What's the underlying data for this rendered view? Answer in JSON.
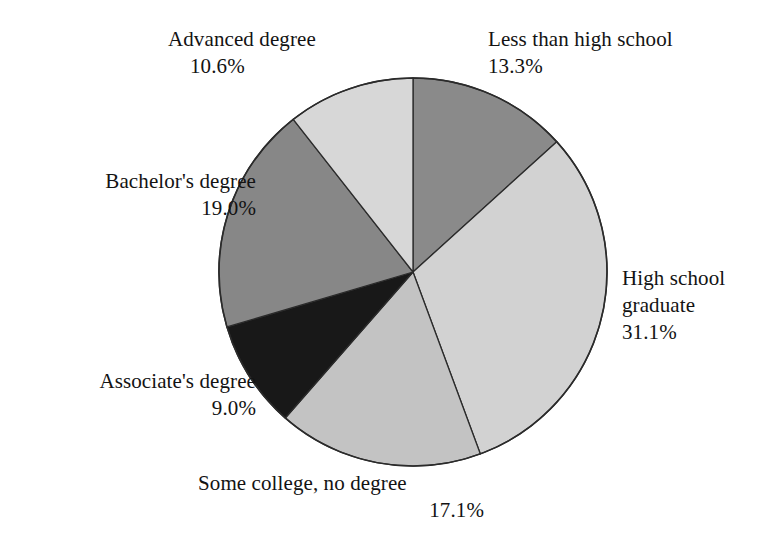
{
  "chart_data": {
    "type": "pie",
    "title": "",
    "subtitle": "",
    "xlabel": "",
    "ylabel": "",
    "legend_position": "none",
    "grid": false,
    "start_angle_deg": 0,
    "direction": "clockwise",
    "categories": [
      "Less than high school",
      "High school graduate",
      "Some college, no degree",
      "Associate's degree",
      "Bachelor's degree",
      "Advanced degree"
    ],
    "values": [
      13.3,
      31.1,
      17.1,
      9.0,
      19.0,
      10.6
    ],
    "value_unit": "%",
    "value_labels": [
      "13.3%",
      "31.1%",
      "17.1%",
      "9.0%",
      "19.0%",
      "10.6%"
    ],
    "slice_colors": [
      "#8a8a8a",
      "#d2d2d2",
      "#c3c3c3",
      "#181818",
      "#878787",
      "#d7d7d7"
    ],
    "slice_outline_color": "#2b2b2b",
    "series": [
      {
        "name": "Educational attainment",
        "values": [
          13.3,
          31.1,
          17.1,
          9.0,
          19.0,
          10.6
        ]
      }
    ]
  },
  "slices": [
    {
      "id": "less-than-high-school",
      "label": "Less than high school",
      "value": "13.3%",
      "color": "#8a8a8a",
      "percent": 13.3
    },
    {
      "id": "high-school-graduate",
      "label_line1": "High school",
      "label_line2": "graduate",
      "label": "High school graduate",
      "value": "31.1%",
      "color": "#d2d2d2",
      "percent": 31.1
    },
    {
      "id": "some-college",
      "label": "Some college, no degree",
      "value": "17.1%",
      "color": "#c3c3c3",
      "percent": 17.1
    },
    {
      "id": "associates-degree",
      "label": "Associate's degree",
      "value": "9.0%",
      "color": "#181818",
      "percent": 9.0
    },
    {
      "id": "bachelors-degree",
      "label": "Bachelor's degree",
      "value": "19.0%",
      "color": "#878787",
      "percent": 19.0
    },
    {
      "id": "advanced-degree",
      "label": "Advanced degree",
      "value": "10.6%",
      "color": "#d7d7d7",
      "percent": 10.6
    }
  ],
  "geometry": {
    "center_x": 413,
    "center_y": 272,
    "radius": 194
  }
}
